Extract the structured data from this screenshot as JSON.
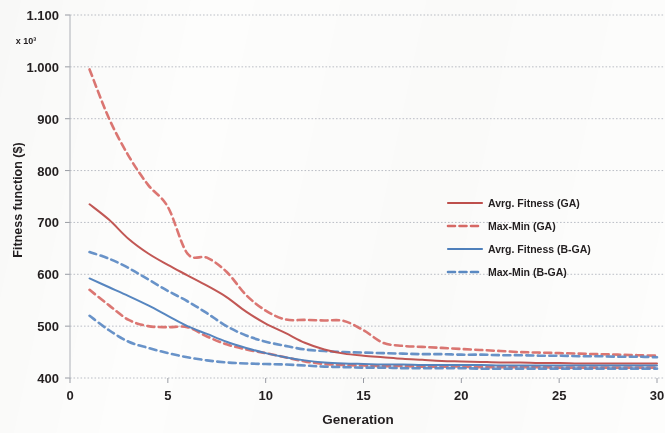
{
  "chart_data": {
    "type": "line",
    "title": "",
    "xlabel": "Generation",
    "ylabel": "Fitness function ($)",
    "y_multiplier": "x 10³",
    "xlim": [
      0,
      30
    ],
    "ylim": [
      400,
      1100
    ],
    "x_ticks": [
      0,
      5,
      10,
      15,
      20,
      25,
      30
    ],
    "x_tick_labels": [
      "0",
      "5",
      "10",
      "15",
      "20",
      "25",
      "30"
    ],
    "y_ticks": [
      400,
      500,
      600,
      700,
      800,
      900,
      1000,
      1100
    ],
    "y_tick_labels": [
      "400",
      "500",
      "600",
      "700",
      "800",
      "900",
      "1.000",
      "1.100"
    ],
    "grid": "horizontal-dotted",
    "legend_position": "inside-center-right",
    "colors": {
      "ga_red": "#C0504D",
      "ga_red_dashed": "#D96A66",
      "bga_blue": "#4F81BD",
      "bga_blue_dashed": "#5B8AC4"
    },
    "x": [
      1,
      2,
      3,
      4,
      5,
      6,
      7,
      8,
      9,
      10,
      11,
      12,
      13,
      14,
      15,
      16,
      17,
      18,
      19,
      20,
      21,
      22,
      23,
      24,
      25,
      26,
      27,
      28,
      29,
      30
    ],
    "series": [
      {
        "name": "Avrg. Fitness (GA)",
        "style": "solid",
        "color": "#C0504D",
        "values": [
          735,
          705,
          668,
          640,
          618,
          598,
          578,
          556,
          528,
          505,
          487,
          468,
          455,
          447,
          443,
          440,
          437,
          435,
          433,
          432,
          431,
          430,
          430,
          429,
          429,
          428,
          428,
          428,
          428,
          428
        ]
      },
      {
        "name": "Max-Min (GA)",
        "style": "dashed",
        "color": "#D96A66",
        "band": "upper",
        "values": [
          995,
          900,
          828,
          772,
          730,
          640,
          632,
          605,
          560,
          530,
          513,
          512,
          511,
          510,
          492,
          468,
          462,
          460,
          458,
          456,
          454,
          452,
          450,
          449,
          448,
          447,
          446,
          445,
          444,
          443
        ]
      },
      {
        "name": "Max-Min (GA)",
        "style": "dashed",
        "color": "#D96A66",
        "band": "lower",
        "values": [
          570,
          540,
          512,
          500,
          498,
          498,
          480,
          465,
          455,
          448,
          440,
          432,
          427,
          425,
          424,
          423,
          423,
          422,
          422,
          422,
          421,
          421,
          421,
          421,
          420,
          420,
          420,
          420,
          420,
          420
        ]
      },
      {
        "name": "Avrg. Fitness (B-GA)",
        "style": "solid",
        "color": "#4F81BD",
        "values": [
          592,
          575,
          558,
          540,
          520,
          500,
          485,
          470,
          458,
          448,
          440,
          434,
          430,
          428,
          427,
          426,
          426,
          425,
          425,
          425,
          425,
          424,
          424,
          424,
          424,
          424,
          424,
          424,
          424,
          424
        ]
      },
      {
        "name": "Max-Min (B-GA)",
        "style": "dashed",
        "color": "#5B8AC4",
        "band": "upper",
        "values": [
          643,
          630,
          612,
          590,
          568,
          548,
          525,
          500,
          482,
          470,
          462,
          455,
          452,
          450,
          449,
          448,
          447,
          446,
          446,
          445,
          445,
          444,
          444,
          443,
          443,
          442,
          442,
          441,
          441,
          440
        ]
      },
      {
        "name": "Max-Min (B-GA)",
        "style": "dashed",
        "color": "#5B8AC4",
        "band": "lower",
        "values": [
          520,
          492,
          470,
          458,
          448,
          440,
          434,
          430,
          428,
          427,
          426,
          424,
          422,
          421,
          420,
          420,
          419,
          419,
          419,
          419,
          418,
          418,
          418,
          418,
          418,
          418,
          418,
          418,
          418,
          418
        ]
      }
    ],
    "legend": [
      {
        "label": "Avrg. Fitness (GA)",
        "color": "#C0504D",
        "style": "solid"
      },
      {
        "label": "Max-Min (GA)",
        "color": "#D96A66",
        "style": "dashed"
      },
      {
        "label": "Avrg. Fitness (B-GA)",
        "color": "#4F81BD",
        "style": "solid"
      },
      {
        "label": "Max-Min (B-GA)",
        "color": "#5B8AC4",
        "style": "dashed"
      }
    ]
  }
}
